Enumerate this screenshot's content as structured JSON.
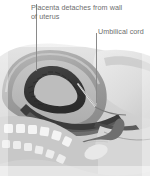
{
  "figure": {
    "type": "medical-anatomical-illustration",
    "width": 150,
    "height": 176,
    "background_color": "#ffffff"
  },
  "labels": [
    {
      "id": "placenta",
      "text": "Placenta detaches from wall of uterus",
      "line1": "Placenta detaches from",
      "line2": "wall of uterus",
      "color": "#6e6e6e",
      "leader_line": {
        "x": 36,
        "y_start": 4,
        "y_end": 71,
        "color": "#8a8a8a"
      }
    },
    {
      "id": "umbilical-cord",
      "text": "Umbilical cord",
      "color": "#6e6e6e",
      "leader_line": {
        "x": 96,
        "y_start": 33,
        "y_end": 103,
        "color": "#8a8a8a"
      }
    }
  ],
  "artwork": {
    "palette": {
      "body_light": "#d8d8d8",
      "body_mid": "#c2c2c2",
      "body_shadow": "#a9a9a9",
      "uterus_wall": "#9b9b9b",
      "uterus_inner": "#b5b5b5",
      "placenta_dark": "#3a3a3a",
      "cavity_dark": "#4a4a4a",
      "bone_white": "#f2f2f2",
      "outline": "#7c7c7c",
      "rectum_dark": "#5a5a5a"
    },
    "structures": [
      "maternal abdomen and pelvis in sagittal section",
      "uterus wall",
      "uterine cavity",
      "detached placenta",
      "umbilical cord",
      "sacrum and lumbar vertebrae",
      "rectum",
      "pubic bone"
    ]
  }
}
